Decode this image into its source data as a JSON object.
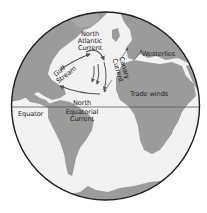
{
  "map": {
    "title": "",
    "projection": "orthographic globe centered on the Atlantic Ocean",
    "colors": {
      "ocean": "#f2f2f2",
      "land": "#9b9b9b",
      "outline": "#1e1e1e",
      "arrows": "#555555",
      "background": "#ffffff"
    },
    "labels": {
      "north_atlantic_current": [
        "North",
        "Atlantic",
        "Current"
      ],
      "gulf_stream": [
        "Gulf",
        "Stream"
      ],
      "canary_current": [
        "Canary",
        "Current"
      ],
      "westerlies": "Westerlies",
      "trade_winds": "Trade winds",
      "equator": "Equator",
      "north_equatorial_current": [
        "North",
        "Equatorial",
        "Current"
      ]
    },
    "features": [
      {
        "name": "Gulf Stream",
        "type": "ocean-current",
        "direction": "northeast"
      },
      {
        "name": "North Atlantic Current",
        "type": "ocean-current",
        "direction": "east"
      },
      {
        "name": "Canary Current",
        "type": "ocean-current",
        "direction": "south"
      },
      {
        "name": "North Equatorial Current",
        "type": "ocean-current",
        "direction": "west"
      },
      {
        "name": "Westerlies",
        "type": "wind",
        "direction": "east"
      },
      {
        "name": "Trade winds",
        "type": "wind",
        "direction": "southwest"
      },
      {
        "name": "Equator",
        "type": "line"
      }
    ]
  }
}
